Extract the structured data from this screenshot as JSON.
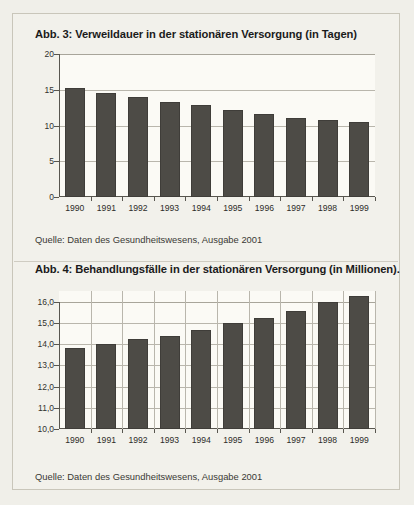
{
  "page": {
    "background_color": "#f0efe9",
    "frame_border_color": "#c9c6ba"
  },
  "figures": [
    {
      "id": "abb-3",
      "title": "Abb. 3: Verweildauer in der stationären Versorgung (in Tagen)",
      "source": "Quelle: Daten des Gesundheitswesens, Ausgabe 2001"
    },
    {
      "id": "abb-4",
      "title": "Abb. 4: Behandlungsfälle in der stationären Versorgung (in Millionen).",
      "source": "Quelle: Daten des Gesundheitswesens, Ausgabe 2001"
    }
  ],
  "chart_data": [
    {
      "type": "bar",
      "title": "Abb. 3: Verweildauer in der stationären Versorgung (in Tagen)",
      "subtitle": "",
      "xlabel": "",
      "ylabel": "",
      "categories": [
        "1990",
        "1991",
        "1992",
        "1993",
        "1994",
        "1995",
        "1996",
        "1997",
        "1998",
        "1999"
      ],
      "values": [
        15.3,
        14.6,
        14.0,
        13.3,
        12.8,
        12.2,
        11.6,
        11.0,
        10.8,
        10.5
      ],
      "ylim": [
        0,
        20
      ],
      "yticks": [
        0,
        5,
        10,
        15,
        20
      ],
      "ytick_labels": [
        "0",
        "5",
        "10",
        "15",
        "20"
      ],
      "grid": "horizontal",
      "legend": "none",
      "bar_color": "#4d4b46",
      "plot_background": "#fbfaf5",
      "source": "Quelle: Daten des Gesundheitswesens, Ausgabe 2001"
    },
    {
      "type": "bar",
      "title": "Abb. 4: Behandlungsfälle in der stationären Versorgung (in Millionen).",
      "subtitle": "",
      "xlabel": "",
      "ylabel": "",
      "categories": [
        "1990",
        "1991",
        "1992",
        "1993",
        "1994",
        "1995",
        "1996",
        "1997",
        "1998",
        "1999"
      ],
      "values": [
        13.8,
        14.0,
        14.25,
        14.4,
        14.65,
        15.0,
        15.25,
        15.55,
        16.0,
        16.25
      ],
      "ylim": [
        10.0,
        16.5
      ],
      "yticks": [
        10.0,
        11.0,
        12.0,
        13.0,
        14.0,
        15.0,
        16.0
      ],
      "ytick_labels": [
        "10,0",
        "11,0",
        "12,0",
        "13,0",
        "14,0",
        "15,0",
        "16,0"
      ],
      "grid": "horizontal",
      "legend": "none",
      "bar_color": "#4d4b46",
      "plot_background": "#fbfaf5",
      "source": "Quelle: Daten des Gesundheitswesens, Ausgabe 2001"
    }
  ]
}
